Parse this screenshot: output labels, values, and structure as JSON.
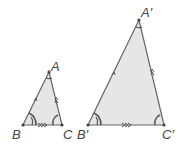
{
  "diagram": {
    "type": "similar-triangles",
    "colors": {
      "fill": "#e6e6e6",
      "stroke": "#666666",
      "arc": "#555555",
      "label": "#444444"
    },
    "small_triangle": {
      "vertices": {
        "A": {
          "label": "A",
          "x": 49,
          "y": 72
        },
        "B": {
          "label": "B",
          "x": 23,
          "y": 125
        },
        "C": {
          "label": "C",
          "x": 62,
          "y": 125
        }
      },
      "markings": {
        "AB": "single arrow",
        "AC": "double arrow",
        "BC": "triple arrow",
        "angle_A": "single arc",
        "angle_B": "double arc",
        "angle_C": "single arc"
      }
    },
    "large_triangle": {
      "vertices": {
        "A": {
          "label": "A′",
          "x": 139,
          "y": 20
        },
        "B": {
          "label": "B′",
          "x": 88,
          "y": 125
        },
        "C": {
          "label": "C′",
          "x": 164,
          "y": 125
        }
      },
      "markings": {
        "AB": "single arrow",
        "AC": "double arrow",
        "BC": "triple arrow",
        "angle_A": "single arc",
        "angle_B": "double arc",
        "angle_C": "single arc"
      }
    }
  }
}
